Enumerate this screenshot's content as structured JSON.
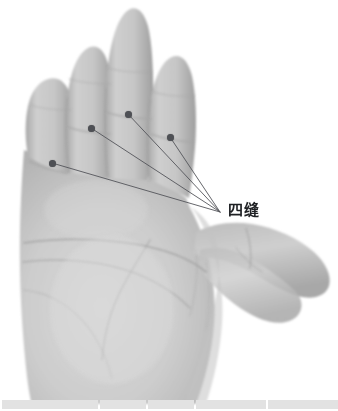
{
  "figure": {
    "canvas": {
      "width": 338,
      "height": 411
    },
    "background_color": "#ffffff",
    "image_kind": "grayscale-photograph"
  },
  "annotation": {
    "label_text": "四缝",
    "label_color": "#1f2124",
    "label_position": {
      "x": 228,
      "y": 203
    },
    "leader_color": "#53555a",
    "leader_width": 0.9,
    "converge_point": {
      "x": 220,
      "y": 212
    },
    "dot_color": "#4e5055",
    "dot_radius": 3.5,
    "points": [
      {
        "name": "sifeng-little-finger",
        "x": 52,
        "y": 163
      },
      {
        "name": "sifeng-ring-finger",
        "x": 91,
        "y": 128
      },
      {
        "name": "sifeng-middle-finger",
        "x": 128,
        "y": 114
      },
      {
        "name": "sifeng-index-finger",
        "x": 170,
        "y": 137
      }
    ]
  },
  "bottom_strip": {
    "color": "#e2e2e2",
    "segments": [
      {
        "width": 96
      },
      {
        "width": 46
      },
      {
        "width": 46
      },
      {
        "width": 70
      },
      {
        "width": 70
      }
    ]
  }
}
